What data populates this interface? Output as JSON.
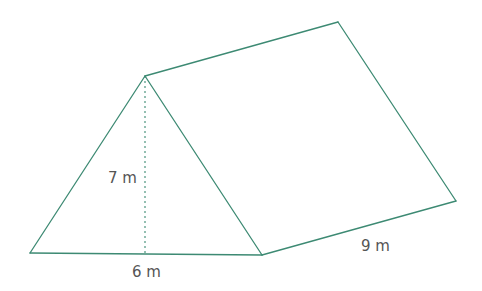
{
  "figure": {
    "type": "triangular-prism",
    "line_color": "#3d8a73",
    "label_color": "#555555",
    "vertices": {
      "apex": [
        145,
        76
      ],
      "front_left": [
        30,
        253
      ],
      "front_right": [
        262,
        255
      ],
      "back_apex": [
        338,
        22
      ],
      "back_right": [
        456,
        201
      ]
    },
    "height_foot": [
      145,
      254
    ],
    "labels": {
      "height": "7 m",
      "base": "6 m",
      "length": "9 m"
    }
  }
}
